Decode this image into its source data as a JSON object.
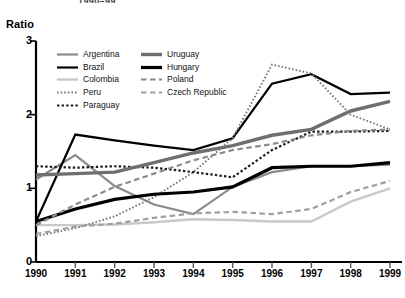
{
  "figure": {
    "title_fragment": "1990–99",
    "y_axis_title": "Ratio"
  },
  "legend": {
    "columns": [
      {
        "entries": [
          {
            "label": "Argentina",
            "color": "#8a8a8a",
            "style": "solid",
            "width": 2.2
          },
          {
            "label": "Brazil",
            "color": "#000000",
            "style": "solid",
            "width": 2.2
          },
          {
            "label": "Colombia",
            "color": "#c9c9c9",
            "style": "solid",
            "width": 2.4
          },
          {
            "label": "Peru",
            "color": "#777777",
            "style": "dotted",
            "width": 1.9
          },
          {
            "label": "Paraguay",
            "color": "#1a1a1a",
            "style": "dotted",
            "width": 2.2
          }
        ]
      },
      {
        "entries": [
          {
            "label": "Uruguay",
            "color": "#6e6e6e",
            "style": "solid",
            "width": 3.4
          },
          {
            "label": "Hungary",
            "color": "#000000",
            "style": "solid",
            "width": 3.2
          },
          {
            "label": "Poland",
            "color": "#8a8a8a",
            "style": "dashed",
            "width": 2.2
          },
          {
            "label": "Czech Republic",
            "color": "#a0a0a0",
            "style": "dashed",
            "width": 2.2
          }
        ]
      }
    ]
  },
  "chart_data": {
    "type": "line",
    "title": "1990–99",
    "xlabel": "",
    "ylabel": "Ratio",
    "x": [
      1990,
      1991,
      1992,
      1993,
      1994,
      1995,
      1996,
      1997,
      1998,
      1999
    ],
    "xtick_labels": [
      "1990",
      "1991",
      "1992",
      "1993",
      "1994",
      "1995",
      "1996",
      "1997",
      "1998",
      "1999"
    ],
    "ylim": [
      0,
      3
    ],
    "ytick_labels": [
      "0",
      "1",
      "2",
      "3"
    ],
    "yticks": [
      0,
      1,
      2,
      3
    ],
    "grid": false,
    "legend_position": "upper-left-inside",
    "series": [
      {
        "name": "Argentina",
        "color": "#8a8a8a",
        "style": "solid",
        "width": 2.2,
        "values": [
          1.12,
          1.45,
          1.03,
          0.78,
          0.65,
          1.02,
          1.22,
          1.3,
          1.3,
          1.32
        ]
      },
      {
        "name": "Brazil",
        "color": "#000000",
        "style": "solid",
        "width": 2.2,
        "values": [
          0.55,
          1.73,
          1.65,
          1.58,
          1.52,
          1.68,
          2.42,
          2.55,
          2.28,
          2.3
        ]
      },
      {
        "name": "Colombia",
        "color": "#c9c9c9",
        "style": "solid",
        "width": 2.4,
        "values": [
          0.5,
          0.5,
          0.51,
          0.54,
          0.58,
          0.57,
          0.55,
          0.55,
          0.82,
          1.0
        ]
      },
      {
        "name": "Peru",
        "color": "#777777",
        "style": "dotted",
        "width": 1.9,
        "values": [
          0.35,
          0.46,
          0.62,
          0.88,
          1.22,
          1.68,
          2.68,
          2.56,
          2.0,
          1.8
        ]
      },
      {
        "name": "Paraguay",
        "color": "#1a1a1a",
        "style": "dotted",
        "width": 2.2,
        "values": [
          1.3,
          1.28,
          1.3,
          1.28,
          1.22,
          1.15,
          1.52,
          1.77,
          1.77,
          1.78
        ]
      },
      {
        "name": "Uruguay",
        "color": "#6e6e6e",
        "style": "solid",
        "width": 3.4,
        "values": [
          1.18,
          1.2,
          1.22,
          1.35,
          1.48,
          1.58,
          1.72,
          1.8,
          2.05,
          2.18
        ]
      },
      {
        "name": "Hungary",
        "color": "#000000",
        "style": "solid",
        "width": 3.2,
        "values": [
          0.55,
          0.72,
          0.85,
          0.92,
          0.95,
          1.02,
          1.28,
          1.3,
          1.3,
          1.35
        ]
      },
      {
        "name": "Poland",
        "color": "#8a8a8a",
        "style": "dashed",
        "width": 2.2,
        "values": [
          0.5,
          0.78,
          1.02,
          1.2,
          1.38,
          1.52,
          1.6,
          1.72,
          1.78,
          1.8
        ]
      },
      {
        "name": "Czech Republic",
        "color": "#a0a0a0",
        "style": "dashed",
        "width": 2.2,
        "values": [
          0.38,
          0.48,
          0.52,
          0.6,
          0.66,
          0.68,
          0.65,
          0.72,
          0.95,
          1.1
        ]
      }
    ]
  }
}
